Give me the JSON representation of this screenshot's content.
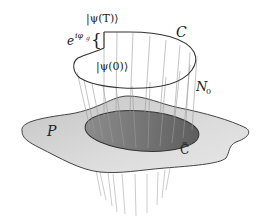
{
  "diagram": {
    "labels": {
      "psi_T": "|ψ(T)⟩",
      "psi_0": "|ψ(0)⟩",
      "phase_base": "e",
      "phase_exp": "iφ",
      "phase_sub": "g",
      "brace": "{",
      "curve_C": "C",
      "bundle": "N",
      "bundle_sub": "0",
      "base_space": "P",
      "projected_curve": "C̃"
    },
    "colors": {
      "background": "#ffffff",
      "base_plane_fill": "#cfcfcf",
      "base_plane_stroke": "#444444",
      "projected_region_fill": "#7a7a7a",
      "curve_stroke": "#333333",
      "fiber_stroke": "#9a9a9a",
      "text": "#222222"
    }
  }
}
